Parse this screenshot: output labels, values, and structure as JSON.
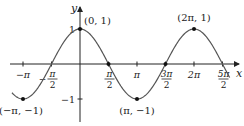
{
  "chart_data": {
    "type": "line",
    "title": "",
    "function": "y = cos x",
    "xlabel": "x",
    "ylabel": "y",
    "xlim": [
      -3.6,
      8.6
    ],
    "ylim": [
      -1.75,
      1.45
    ],
    "grid": false,
    "legend": "none",
    "x_ticks": [
      {
        "value": -3.14159,
        "label": "−π"
      },
      {
        "value": -1.5708,
        "label": "−π/2",
        "num": "π",
        "neg": true
      },
      {
        "value": 1.5708,
        "label": "π/2",
        "num": "π"
      },
      {
        "value": 3.14159,
        "label": "π"
      },
      {
        "value": 4.7124,
        "label": "3π/2",
        "num": "3π"
      },
      {
        "value": 6.28318,
        "label": "2π"
      },
      {
        "value": 7.854,
        "label": "5π/2",
        "num": "5π"
      }
    ],
    "y_ticks": [
      {
        "value": 1,
        "label": "1"
      },
      {
        "value": -1,
        "label": "−1"
      }
    ],
    "labeled_points": [
      {
        "x": 0,
        "y": 1,
        "label": "(0, 1)"
      },
      {
        "x": 6.28318,
        "y": 1,
        "label": "(2π, 1)"
      },
      {
        "x": -3.14159,
        "y": -1,
        "label": "(−π, −1)"
      },
      {
        "x": 3.14159,
        "y": -1,
        "label": "(π, −1)"
      }
    ],
    "marked_points": [
      {
        "x": 1.5708,
        "y": 0
      },
      {
        "x": 4.7124,
        "y": 0
      }
    ],
    "series": [
      {
        "name": "cos x",
        "color": "#555555",
        "x_range": [
          -3.75,
          8.25
        ]
      }
    ]
  }
}
